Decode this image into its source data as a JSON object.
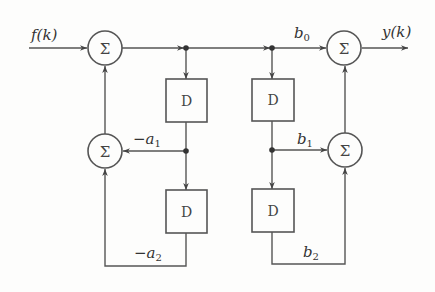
{
  "diagram": {
    "type": "signal-flow block diagram (direct form II digital filter)",
    "input_label": "f(k)",
    "output_label": "y(k)",
    "summer_symbol": "Σ",
    "delay_label": "D",
    "coefficients": {
      "a1": {
        "sign": "−",
        "base": "a",
        "sub": "1"
      },
      "a2": {
        "sign": "−",
        "base": "a",
        "sub": "2"
      },
      "b0": {
        "sign": "",
        "base": "b",
        "sub": "0"
      },
      "b1": {
        "sign": "",
        "base": "b",
        "sub": "1"
      },
      "b2": {
        "sign": "",
        "base": "b",
        "sub": "2"
      }
    },
    "nodes": [
      {
        "id": "sum-input",
        "type": "summer"
      },
      {
        "id": "sum-feedback",
        "type": "summer"
      },
      {
        "id": "sum-output",
        "type": "summer"
      },
      {
        "id": "sum-feedforward",
        "type": "summer"
      },
      {
        "id": "delay-1",
        "type": "delay"
      },
      {
        "id": "delay-2",
        "type": "delay"
      },
      {
        "id": "delay-3",
        "type": "delay"
      },
      {
        "id": "delay-4",
        "type": "delay"
      }
    ],
    "edges": [
      {
        "from": "f(k)",
        "to": "sum-input"
      },
      {
        "from": "sum-input",
        "to": "delay-1"
      },
      {
        "from": "sum-input",
        "to": "delay-2"
      },
      {
        "from": "sum-input",
        "to": "sum-output",
        "label": "b0"
      },
      {
        "from": "delay-1",
        "to": "sum-feedback",
        "label": "−a1"
      },
      {
        "from": "delay-1",
        "to": "delay-3"
      },
      {
        "from": "delay-3",
        "to": "sum-feedback",
        "label": "−a2"
      },
      {
        "from": "sum-feedback",
        "to": "sum-input"
      },
      {
        "from": "delay-2",
        "to": "sum-feedforward",
        "label": "b1"
      },
      {
        "from": "delay-2",
        "to": "delay-4"
      },
      {
        "from": "delay-4",
        "to": "sum-feedforward",
        "label": "b2"
      },
      {
        "from": "sum-feedforward",
        "to": "sum-output"
      },
      {
        "from": "sum-output",
        "to": "y(k)"
      }
    ]
  }
}
